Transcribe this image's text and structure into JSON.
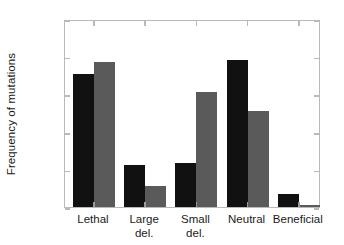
{
  "chart_data": {
    "type": "bar",
    "title": "",
    "xlabel": "",
    "ylabel": "Frequency of mutations",
    "categories": [
      "Lethal",
      "Large\ndel.",
      "Small\ndel.",
      "Neutral",
      "Beneficial"
    ],
    "category_labels_flat": [
      "Lethal",
      "Large del.",
      "Small del.",
      "Neutral",
      "Beneficial"
    ],
    "series": [
      {
        "name": "series-1",
        "color": "#111111",
        "values": [
          0.353,
          0.112,
          0.117,
          0.39,
          0.035
        ]
      },
      {
        "name": "series-2",
        "color": "#5a5a5a",
        "values": [
          0.385,
          0.056,
          0.305,
          0.255,
          0.005
        ]
      }
    ],
    "ylim": [
      0.0,
      0.5
    ],
    "ytick_values": [
      0.0,
      0.1,
      0.2,
      0.3,
      0.4,
      0.5
    ],
    "ytick_labels": [
      "0.0",
      "0.1",
      "0.2",
      "0.3",
      "0.4",
      "0.5"
    ],
    "grid": false,
    "legend": "none",
    "frame_color": "#b9b9b9"
  }
}
